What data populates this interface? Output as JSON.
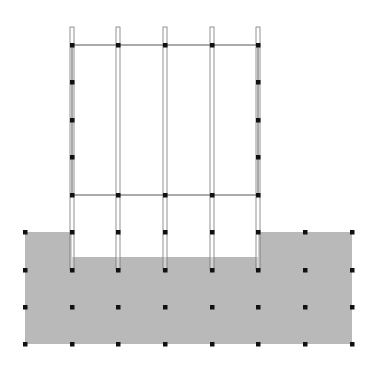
{
  "diagram": {
    "type": "structural-frame-on-soil-grid",
    "colors": {
      "background": "#ffffff",
      "soil": "#b9b9b9",
      "frame_line": "#555555",
      "column_outline": "#777777",
      "node": "#111111"
    },
    "grid": {
      "x": [
        25,
        72,
        118,
        165,
        212,
        258,
        305,
        352
      ],
      "frame_y": [
        45,
        82,
        120,
        157,
        195
      ],
      "soil_y": [
        232,
        270,
        307,
        344
      ]
    },
    "soil": {
      "outer_left": 25,
      "outer_right": 352,
      "outer_top": 232,
      "excavation_left": 72,
      "excavation_right": 258,
      "excavation_bottom": 257,
      "bottom": 344
    },
    "frame": {
      "left": 72,
      "right": 258,
      "top": 45,
      "bottom": 195,
      "column_x": [
        72,
        118,
        165,
        212,
        258
      ],
      "stub_top": 27,
      "pile_bottom": 270
    }
  }
}
